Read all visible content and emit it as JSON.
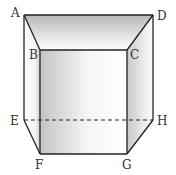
{
  "diagram": {
    "type": "geometric-solid",
    "vertices": {
      "A": {
        "label": "A",
        "x": 24,
        "y": 15
      },
      "B": {
        "label": "B",
        "x": 40,
        "y": 50
      },
      "C": {
        "label": "C",
        "x": 127,
        "y": 50
      },
      "D": {
        "label": "D",
        "x": 153,
        "y": 15
      },
      "E": {
        "label": "E",
        "x": 24,
        "y": 120
      },
      "F": {
        "label": "F",
        "x": 40,
        "y": 154
      },
      "G": {
        "label": "G",
        "x": 127,
        "y": 154
      },
      "H": {
        "label": "H",
        "x": 153,
        "y": 120
      }
    },
    "edges_solid": [
      "AD",
      "AB",
      "DC",
      "BC",
      "AE",
      "DH",
      "BF",
      "CG",
      "FG",
      "EF",
      "HG"
    ],
    "edges_dashed": [
      "EH"
    ],
    "colors": {
      "stroke": "#222222",
      "shade_dark": "#b8b8b8",
      "shade_light": "#ffffff",
      "label": "#333333"
    }
  }
}
